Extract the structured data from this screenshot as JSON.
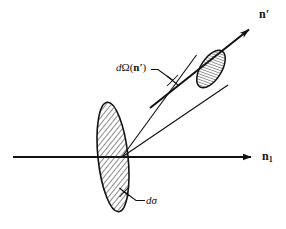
{
  "figure": {
    "kind": "scattering-cross-section-diagram",
    "background_color": "#ffffff",
    "ink_color": "#111111",
    "hatch_color": "#2b2b2b",
    "width": 286,
    "height": 229,
    "labels": {
      "incident_direction": "n",
      "incident_direction_subscript": "1",
      "scattered_direction": "n",
      "scattered_direction_prime": "′",
      "solid_angle_d": "d",
      "solid_angle_omega": "Ω",
      "solid_angle_open_paren": "(",
      "solid_angle_vector": "n",
      "solid_angle_prime": "′",
      "solid_angle_close_paren": ")",
      "cross_section": "dσ"
    },
    "geometry": {
      "scattering_vertex": [
        122,
        157
      ],
      "axis_line_start": [
        13,
        157
      ],
      "axis_arrow_tip": [
        258,
        157
      ],
      "nprime_arrow_start": [
        150,
        108
      ],
      "nprime_arrow_tip": [
        256,
        24
      ],
      "cone_upper_edge": [
        [
          122,
          157
        ],
        [
          196,
          55
        ]
      ],
      "cone_lower_edge": [
        [
          122,
          157
        ],
        [
          228,
          84
        ]
      ],
      "target_ellipse_center": [
        113,
        157
      ],
      "target_ellipse_rx": 15,
      "target_ellipse_ry": 55,
      "target_ellipse_rotation_deg": -6,
      "detector_ellipse_center": [
        211,
        69
      ],
      "detector_ellipse_rx": 10,
      "detector_ellipse_ry": 21,
      "detector_ellipse_rotation_deg": 32,
      "domega_leader": [
        [
          152,
          70
        ],
        [
          172,
          80
        ]
      ],
      "domega_tick_center": [
        172,
        80
      ],
      "dsigma_leader": [
        [
          126,
          195
        ],
        [
          145,
          200
        ]
      ]
    }
  }
}
